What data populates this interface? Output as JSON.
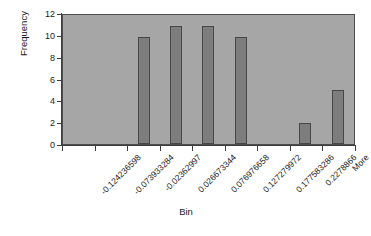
{
  "chart_data": {
    "type": "bar",
    "title": "",
    "xlabel": "Bin",
    "ylabel": "Frequency",
    "categories": [
      "-0.124236598",
      "-0.073933284",
      "-0.02362997",
      "0.026673344",
      "0.076976658",
      "0.127279972",
      "0.177583286",
      "0.2278866",
      "More"
    ],
    "values": [
      0,
      0,
      10,
      11,
      11,
      10,
      0,
      2,
      5
    ],
    "extra_values_note": "",
    "ylim": [
      0,
      12
    ],
    "yticks": [
      0,
      2,
      4,
      6,
      8,
      10,
      12
    ],
    "ytick_labels": [
      "0",
      "2",
      "4",
      "6",
      "8",
      "10",
      "12"
    ],
    "grid": false,
    "legend": false,
    "series": [
      {
        "name": "Frequency",
        "values": [
          0,
          0,
          10,
          11,
          11,
          10,
          0,
          2,
          5
        ]
      }
    ],
    "colors": {
      "bar_fill": "#7d7d7d",
      "bar_border": "#474747",
      "plot_background": "#a6a6a6",
      "axis": "#3d3d3d",
      "text": "#1a1a1a",
      "page_background": "#ffffff"
    }
  }
}
